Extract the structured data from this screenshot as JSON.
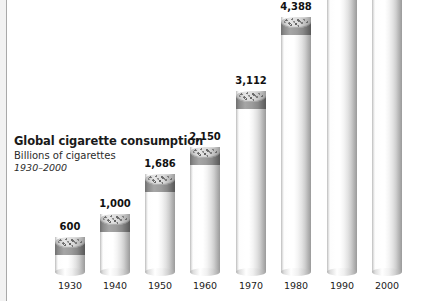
{
  "title": {
    "heading": "Global cigarette consumption",
    "subheading": "Billions of cigarettes",
    "range": "1930–2000"
  },
  "chart_data": {
    "type": "bar",
    "title": "Global cigarette consumption",
    "subtitle": "Billions of cigarettes",
    "annotations": [
      "1930–2000"
    ],
    "xlabel": "",
    "ylabel": "Billions of cigarettes",
    "ylim": [
      0,
      5500
    ],
    "grid": false,
    "legend": "none",
    "categories": [
      "1930",
      "1940",
      "1950",
      "1960",
      "1970",
      "1980",
      "1990",
      "2000"
    ],
    "values": [
      600,
      1000,
      1686,
      2150,
      3112,
      4388,
      5419,
      5500
    ],
    "value_labels": [
      "600",
      "1,000",
      "1,686",
      "2,150",
      "3,112",
      "4,388",
      "5,419",
      "5,500"
    ],
    "bar_style": "cigarette-cylinder",
    "colors": {
      "bar_paper": "#ffffff",
      "bar_shade": "#9a9a9a",
      "tobacco_band": "#8a8a8a",
      "tobacco_top": "#cfcfcf",
      "label_text": "#111111",
      "frame_border": "#a9a9a9",
      "background": "#ffffff"
    }
  },
  "bars": [
    {
      "year": "1930",
      "value_label": "600",
      "px_height": 35,
      "px_left": 45
    },
    {
      "year": "1940",
      "value_label": "1,000",
      "px_height": 58,
      "px_left": 90
    },
    {
      "year": "1950",
      "value_label": "1,686",
      "px_height": 98,
      "px_left": 135
    },
    {
      "year": "1960",
      "value_label": "2,150",
      "px_height": 125,
      "px_left": 180
    },
    {
      "year": "1970",
      "value_label": "3,112",
      "px_height": 181,
      "px_left": 226
    },
    {
      "year": "1980",
      "value_label": "4,388",
      "px_height": 255,
      "px_left": 271
    },
    {
      "year": "1990",
      "value_label": "5,419",
      "px_height": 315,
      "px_left": 317
    },
    {
      "year": "2000",
      "value_label": "5,500",
      "px_height": 320,
      "px_left": 362
    }
  ]
}
